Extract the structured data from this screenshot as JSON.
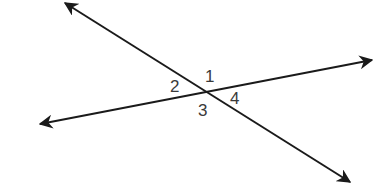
{
  "diagram": {
    "type": "intersecting-lines",
    "line_color": "#1a1a1a",
    "label_color": "#3a3a3a",
    "lines": [
      {
        "name": "line-a",
        "from": [
          65,
          3
        ],
        "to": [
          350,
          182
        ]
      },
      {
        "name": "line-b",
        "from": [
          40,
          124
        ],
        "to": [
          372,
          60
        ]
      }
    ],
    "intersection": [
      205,
      91
    ],
    "angle_labels": [
      {
        "id": "1",
        "text": "1",
        "x": 205,
        "y": 82
      },
      {
        "id": "2",
        "text": "2",
        "x": 170,
        "y": 92
      },
      {
        "id": "3",
        "text": "3",
        "x": 198,
        "y": 116
      },
      {
        "id": "4",
        "text": "4",
        "x": 230,
        "y": 104
      }
    ]
  }
}
